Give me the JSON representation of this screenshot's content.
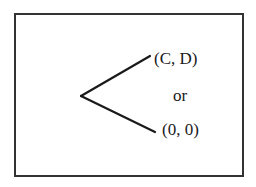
{
  "diagram": {
    "type": "decision-tree-branch",
    "outcomes": {
      "top": "(C, D)",
      "connector": "or",
      "bottom": "(0, 0)"
    },
    "colors": {
      "line": "#1a1a1a",
      "border": "#333333",
      "background": "#ffffff"
    }
  }
}
